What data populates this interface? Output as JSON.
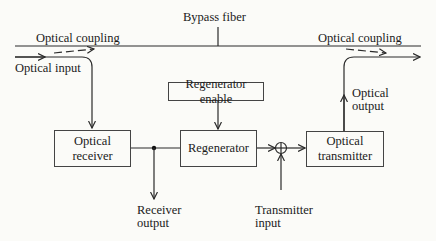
{
  "diagram": {
    "title_label": "Bypass fiber",
    "labels": {
      "optical_coupling_left": "Optical coupling",
      "optical_coupling_right": "Optical coupling",
      "optical_input": "Optical input",
      "optical_output_line1": "Optical",
      "optical_output_line2": "output",
      "receiver_output_line1": "Receiver",
      "receiver_output_line2": "output",
      "transmitter_input_line1": "Transmitter",
      "transmitter_input_line2": "input"
    },
    "blocks": {
      "optical_receiver": {
        "line1": "Optical",
        "line2": "receiver"
      },
      "regenerator_enable": {
        "label": "Regenerator enable"
      },
      "regenerator": {
        "label": "Regenerator"
      },
      "optical_transmitter": {
        "line1": "Optical",
        "line2": "transmitter"
      }
    },
    "summing_junction": "+",
    "colors": {
      "line": "#2a2a2a",
      "background": "#fbfbf8",
      "text": "#1a1a1a"
    }
  }
}
